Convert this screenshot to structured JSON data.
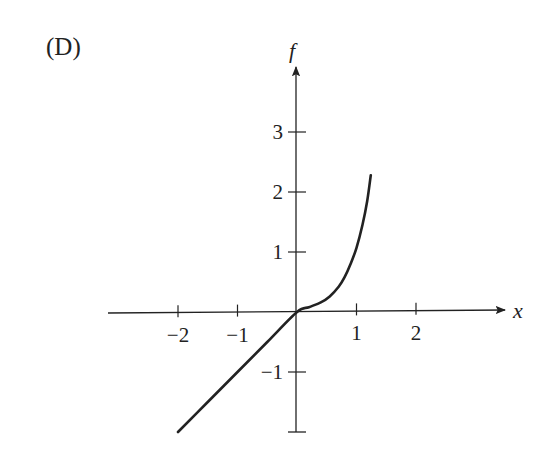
{
  "panel": {
    "label": "(D)"
  },
  "chart_data": {
    "type": "line",
    "title": "(D)",
    "xlabel": "x",
    "ylabel": "f",
    "xlim": [
      -3.2,
      3.5
    ],
    "ylim": [
      -2,
      4.4
    ],
    "grid": false,
    "legend": null,
    "x_ticks": [
      -2,
      -1,
      1,
      2
    ],
    "x_tick_labels": [
      "−2",
      "−1",
      "1",
      "2"
    ],
    "y_ticks": [
      -1,
      1,
      2,
      3
    ],
    "y_tick_labels": [
      "−1",
      "1",
      "2",
      "3"
    ],
    "series": [
      {
        "name": "f",
        "x": [
          -2.0,
          -1.5,
          -1.0,
          -0.5,
          0.0,
          0.2,
          0.4,
          0.55,
          0.7,
          0.8,
          0.9,
          1.0,
          1.1,
          1.18,
          1.24
        ],
        "y": [
          -2.0,
          -1.5,
          -1.0,
          -0.5,
          0.0,
          0.08,
          0.16,
          0.26,
          0.42,
          0.58,
          0.8,
          1.07,
          1.45,
          1.85,
          2.28
        ]
      }
    ],
    "annotations": [
      "Piecewise: linear f = x for x < 0, convex rising curve for x > 0"
    ]
  },
  "colors": {
    "ink": "#222222",
    "background": "#ffffff"
  }
}
